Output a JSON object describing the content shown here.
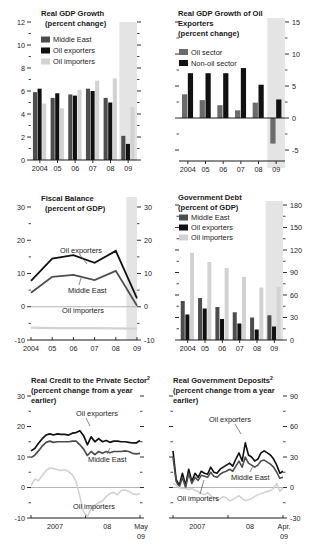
{
  "figure": {
    "panel_count": 6,
    "colors": {
      "middle_east": "#4d4d4d",
      "oil_exporters": "#111111",
      "oil_importers": "#d2d2d2",
      "oil_sector": "#6b6b6b",
      "non_oil_sector": "#111111",
      "forecast_band": "#e4e4e4",
      "axis": "#1a1a1a",
      "text": "#1a1a1a"
    }
  },
  "chart_data": [
    {
      "id": "real-gdp-growth",
      "type": "bar",
      "title": "Real GDP Growth",
      "subtitle": "(percent change)",
      "xlabel": "",
      "ylabel": "",
      "ylim": [
        0,
        12
      ],
      "yticks": [
        0,
        2,
        4,
        6,
        8,
        10,
        12
      ],
      "ytick_labels": [
        "0",
        "2",
        "4",
        "6",
        "8",
        "10",
        "12"
      ],
      "grid": false,
      "legend_position": "top-left",
      "categories": [
        "2004",
        "05",
        "06",
        "07",
        "08",
        "09"
      ],
      "forecast_categories": [
        "09"
      ],
      "series": [
        {
          "name": "Middle East",
          "color": "#4d4d4d",
          "values": [
            5.9,
            5.4,
            5.7,
            6.2,
            5.4,
            2.1
          ]
        },
        {
          "name": "Oil exporters",
          "color": "#111111",
          "values": [
            6.2,
            5.8,
            5.6,
            6.0,
            5.0,
            1.4
          ]
        },
        {
          "name": "Oil importers",
          "color": "#d2d2d2",
          "values": [
            4.9,
            4.5,
            6.1,
            6.9,
            7.1,
            4.6
          ]
        }
      ]
    },
    {
      "id": "real-gdp-growth-oil-exporters",
      "type": "bar",
      "title": "Real GDP Growth of Oil",
      "title2": "Exporters",
      "subtitle": "(percent change)",
      "xlabel": "",
      "ylabel": "",
      "ylim": [
        -5,
        15
      ],
      "yticks": [
        -5,
        0,
        5,
        10,
        15
      ],
      "ytick_labels": [
        "-5",
        "0",
        "5",
        "10",
        "15"
      ],
      "grid": false,
      "legend_position": "top-left",
      "categories": [
        "2004",
        "05",
        "06",
        "07",
        "08",
        "09"
      ],
      "forecast_categories": [
        "09"
      ],
      "series": [
        {
          "name": "Oil sector",
          "color": "#6b6b6b",
          "values": [
            3.7,
            2.8,
            2.0,
            1.2,
            2.4,
            -4.0
          ]
        },
        {
          "name": "Non-oil sector",
          "color": "#111111",
          "values": [
            7.0,
            7.0,
            7.0,
            7.8,
            5.2,
            2.9
          ]
        }
      ]
    },
    {
      "id": "fiscal-balance",
      "type": "line",
      "title": "Fiscal Balance",
      "subtitle": "(percent of GDP)",
      "xlabel": "",
      "ylabel": "",
      "ylim": [
        -10,
        30
      ],
      "yticks": [
        -10,
        0,
        10,
        20,
        30
      ],
      "ytick_labels": [
        "-10",
        "0",
        "10",
        "20",
        "30"
      ],
      "grid": false,
      "legend_position": "inline-annotations",
      "x": [
        "2004",
        "05",
        "06",
        "07",
        "08",
        "09"
      ],
      "series": [
        {
          "name": "Oil exporters",
          "color": "#111111",
          "values": [
            7.8,
            14.5,
            15.5,
            13.2,
            16.8,
            2.5
          ]
        },
        {
          "name": "Middle East",
          "color": "#4d4d4d",
          "values": [
            4.2,
            9.0,
            9.6,
            8.0,
            10.8,
            0.3
          ]
        },
        {
          "name": "Oil importers",
          "color": "#d2d2d2",
          "values": [
            -6.3,
            -6.4,
            -6.4,
            -6.4,
            -6.5,
            -6.6
          ]
        }
      ]
    },
    {
      "id": "government-debt",
      "type": "bar",
      "title": "Government Debt",
      "subtitle": "(percent of GDP)",
      "xlabel": "",
      "ylabel": "",
      "ylim": [
        0,
        180
      ],
      "yticks": [
        0,
        30,
        60,
        90,
        120,
        150,
        180
      ],
      "ytick_labels": [
        "0",
        "30",
        "60",
        "90",
        "120",
        "150",
        "180"
      ],
      "grid": false,
      "legend_position": "top-left",
      "categories": [
        "2004",
        "05",
        "06",
        "07",
        "08",
        "09"
      ],
      "forecast_categories": [
        "09"
      ],
      "series": [
        {
          "name": "Middle East",
          "color": "#4d4d4d",
          "values": [
            52,
            56,
            44,
            37,
            30,
            33
          ]
        },
        {
          "name": "Oil exporters",
          "color": "#111111",
          "values": [
            34,
            42,
            28,
            22,
            14,
            18
          ]
        },
        {
          "name": "Oil importers",
          "color": "#d2d2d2",
          "values": [
            116,
            104,
            96,
            84,
            70,
            71
          ]
        }
      ]
    },
    {
      "id": "real-credit-private-sector",
      "type": "line",
      "title": "Real Credit to the Private Sector",
      "title_footnote": "2",
      "subtitle": "(percent change from a year",
      "subtitle2": "earlier)",
      "xlabel": "",
      "ylabel": "",
      "ylim": [
        -10,
        30
      ],
      "yticks": [
        -10,
        0,
        10,
        20,
        30
      ],
      "ytick_labels": [
        "-10",
        "0",
        "10",
        "20",
        "30"
      ],
      "grid": false,
      "legend_position": "inline-annotations",
      "xtick_labels": [
        "2007",
        "08",
        "May"
      ],
      "xtick_label_end_line2": "09",
      "series": [
        {
          "name": "Oil exporters",
          "color": "#111111",
          "values": [
            12.0,
            12.8,
            14.5,
            16.0,
            17.2,
            17.6,
            17.2,
            17.6,
            17.4,
            17.4,
            17.2,
            17.8,
            18.0,
            18.6,
            17.0,
            14.0,
            16.6,
            15.0,
            16.0,
            15.0,
            15.4,
            14.8,
            15.2,
            15.2,
            15.0,
            15.0,
            14.8,
            14.6,
            14.6,
            15.4
          ]
        },
        {
          "name": "Middle East",
          "color": "#4d4d4d",
          "values": [
            9.8,
            10.6,
            12.0,
            13.6,
            14.8,
            15.2,
            14.8,
            15.0,
            15.0,
            15.0,
            15.0,
            15.2,
            15.2,
            14.0,
            12.6,
            10.5,
            11.8,
            10.8,
            11.8,
            11.2,
            11.8,
            11.4,
            11.8,
            11.8,
            11.8,
            12.0,
            11.8,
            11.2,
            11.0,
            11.2
          ]
        },
        {
          "name": "Oil importers",
          "color": "#d2d2d2",
          "values": [
            0.5,
            2.8,
            2.2,
            4.0,
            5.5,
            6.4,
            6.2,
            5.8,
            5.6,
            5.8,
            5.2,
            4.2,
            2.0,
            -3.0,
            -8.0,
            -9.5,
            -7.0,
            -5.8,
            -5.0,
            -4.4,
            -3.0,
            -2.0,
            -1.6,
            -2.4,
            -1.0,
            -0.8,
            -1.2,
            -2.0,
            -2.4,
            -2.0
          ]
        }
      ]
    },
    {
      "id": "real-government-deposits",
      "type": "line",
      "title": "Real Government Deposits",
      "title_footnote": "2",
      "subtitle": "(percent change from a year",
      "subtitle2": "earlier)",
      "xlabel": "",
      "ylabel": "",
      "ylim": [
        -30,
        90
      ],
      "yticks": [
        -30,
        0,
        30,
        60,
        90
      ],
      "ytick_labels": [
        "-30",
        "0",
        "30",
        "60",
        "90"
      ],
      "grid": false,
      "legend_position": "inline-annotations",
      "xtick_labels": [
        "2007",
        "08",
        "Apr."
      ],
      "xtick_label_end_line2": "09",
      "series": [
        {
          "name": "Oil exporters",
          "color": "#111111",
          "values": [
            36,
            8,
            2,
            14,
            2,
            18,
            6,
            14,
            10,
            16,
            14,
            13,
            20,
            15,
            14,
            18,
            20,
            22,
            24,
            21,
            28,
            34,
            26,
            44,
            32,
            30,
            26,
            28,
            34,
            36,
            34,
            32,
            28,
            22,
            14,
            16
          ]
        },
        {
          "name": "Middle East",
          "color": "#4d4d4d",
          "values": [
            30,
            6,
            0,
            10,
            0,
            14,
            4,
            10,
            7,
            12,
            11,
            10,
            15,
            11,
            10,
            13,
            15,
            16,
            18,
            16,
            21,
            26,
            20,
            30,
            24,
            22,
            20,
            22,
            26,
            27,
            25,
            23,
            20,
            15,
            9,
            10
          ]
        },
        {
          "name": "Oil importers",
          "color": "#d2d2d2",
          "values": [
            4,
            2,
            0,
            -1,
            -1,
            -2,
            -1,
            -3,
            -4,
            -6,
            -7,
            -5,
            -8,
            -10,
            -12,
            -11,
            -9,
            -10,
            -13,
            -12,
            -10,
            -8,
            -11,
            -13,
            -12,
            -11,
            -9,
            -7,
            -6,
            -5,
            -4,
            -3,
            -1,
            4,
            -4,
            0
          ]
        }
      ]
    }
  ]
}
